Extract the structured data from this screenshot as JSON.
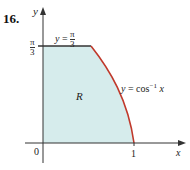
{
  "figure": {
    "problem_number": "16.",
    "axis_labels": {
      "x": "x",
      "y": "y"
    },
    "ticks": {
      "origin": "0",
      "x_one": "1",
      "y_top_num": "π",
      "y_top_den": "3"
    },
    "region_label": "R",
    "top_line_label": {
      "lhs": "y",
      "eq": "=",
      "num": "π",
      "den": "3"
    },
    "curve_label": {
      "lhs": "y",
      "eq": "=",
      "fn": "cos",
      "sup": "−1",
      "arg": "x"
    },
    "colors": {
      "fill": "#d6ecec",
      "curve": "#c0392b",
      "line": "#333333",
      "axis": "#333333"
    }
  }
}
